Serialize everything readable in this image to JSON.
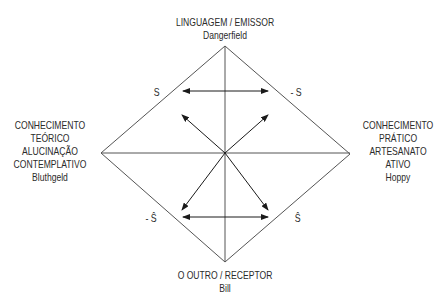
{
  "top": {
    "lines": [
      "LINGUAGEM / EMISSOR",
      "Dangerfield"
    ]
  },
  "left": {
    "lines": [
      "CONHECIMENTO",
      "TEÓRICO",
      "ALUCINAÇÃO",
      "CONTEMPLATIVO",
      "Bluthgeld"
    ]
  },
  "right": {
    "lines": [
      "CONHECIMENTO",
      "PRÁTICO",
      "ARTESANATO",
      "ATIVO",
      "Hoppy"
    ]
  },
  "bottom": {
    "lines": [
      "O OUTRO / RECEPTOR",
      "Bill"
    ]
  },
  "symbols": {
    "upper_left": "S",
    "upper_right": "- S",
    "lower_left": "- Ŝ",
    "lower_right": "Ŝ"
  },
  "colors": {
    "line": "#555555",
    "text": "#2b2b2b",
    "background": "#ffffff"
  }
}
